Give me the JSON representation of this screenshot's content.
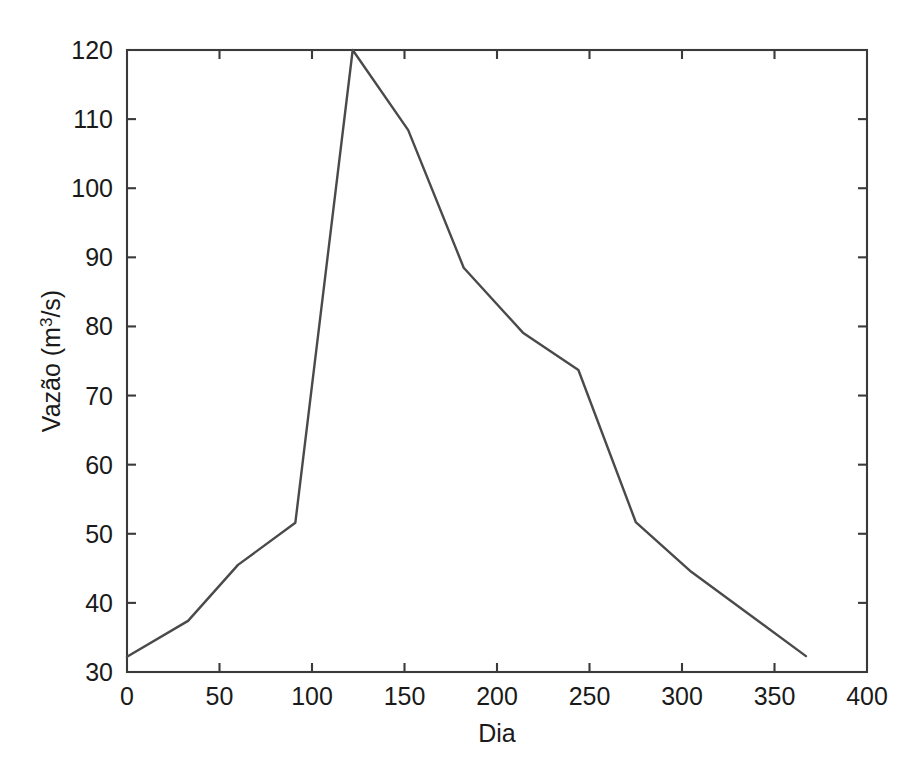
{
  "chart_data": {
    "type": "line",
    "title": "",
    "subtitle": "",
    "xlabel": "Dia",
    "ylabel": "Vazão (m³/s)",
    "ylabel_base": "Vazão (m",
    "ylabel_sup": "3",
    "ylabel_tail": "/s)",
    "xlim": [
      0,
      400
    ],
    "ylim": [
      30,
      120
    ],
    "xticks": [
      0,
      50,
      100,
      150,
      200,
      250,
      300,
      350,
      400
    ],
    "yticks": [
      30,
      40,
      50,
      60,
      70,
      80,
      90,
      100,
      110,
      120
    ],
    "xtick_labels": [
      "0",
      "50",
      "100",
      "150",
      "200",
      "250",
      "300",
      "350",
      "400"
    ],
    "ytick_labels": [
      "30",
      "40",
      "50",
      "60",
      "70",
      "80",
      "90",
      "100",
      "110",
      "120"
    ],
    "grid": false,
    "legend": false,
    "legend_position": "none",
    "series": [
      {
        "name": "Vazão",
        "color": "#4a4a4a",
        "x": [
          0,
          33,
          60,
          91,
          122,
          152,
          182,
          214,
          244,
          275,
          305,
          367
        ],
        "y": [
          32.2,
          37.4,
          45.5,
          51.6,
          120.0,
          108.4,
          88.5,
          79.1,
          73.7,
          51.7,
          44.5,
          32.3
        ]
      }
    ]
  },
  "figure": {
    "background_color": "#ffffff",
    "axis_color": "#3a3a3a",
    "line_color": "#4a4a4a"
  }
}
